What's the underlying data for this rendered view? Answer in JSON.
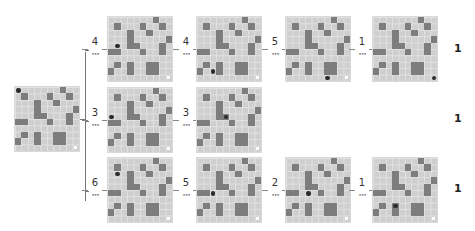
{
  "diagram": {
    "grid_size": 10,
    "colors": {
      "floor": "#cfcfcf",
      "obstacle": "#7d7d7d",
      "agent": "#2b2b2b",
      "goal": "#ffffff"
    },
    "obstacles": [
      [
        0,
        7
      ],
      [
        1,
        1
      ],
      [
        1,
        5
      ],
      [
        1,
        8
      ],
      [
        2,
        3
      ],
      [
        2,
        6
      ],
      [
        3,
        3
      ],
      [
        3,
        9
      ],
      [
        4,
        3
      ],
      [
        4,
        4
      ],
      [
        4,
        8
      ],
      [
        5,
        0
      ],
      [
        5,
        1
      ],
      [
        5,
        5
      ],
      [
        5,
        8
      ],
      [
        7,
        1
      ],
      [
        7,
        3
      ],
      [
        7,
        6
      ],
      [
        7,
        7
      ],
      [
        8,
        0
      ],
      [
        8,
        3
      ],
      [
        8,
        6
      ],
      [
        8,
        7
      ]
    ],
    "initial": {
      "agent": [
        0,
        0
      ]
    },
    "branches": [
      {
        "steps": [
          {
            "label": "4",
            "agent": [
              4,
              1
            ]
          },
          {
            "label": "4",
            "agent": [
              8,
              2
            ]
          },
          {
            "label": "5",
            "agent": [
              9,
              6
            ]
          },
          {
            "label": "1",
            "agent": [
              9,
              9
            ]
          }
        ],
        "score": "1"
      },
      {
        "steps": [
          {
            "label": "3",
            "agent": [
              4,
              0
            ]
          },
          {
            "label": "3",
            "agent": [
              4,
              4
            ]
          }
        ],
        "score": "1"
      },
      {
        "steps": [
          {
            "label": "6",
            "agent": [
              2,
              1
            ]
          },
          {
            "label": "5",
            "agent": [
              5,
              2
            ]
          },
          {
            "label": "2",
            "agent": [
              5,
              3
            ]
          },
          {
            "label": "1",
            "agent": [
              7,
              3
            ]
          }
        ],
        "score": "1"
      }
    ],
    "ellipsis": "•••"
  }
}
